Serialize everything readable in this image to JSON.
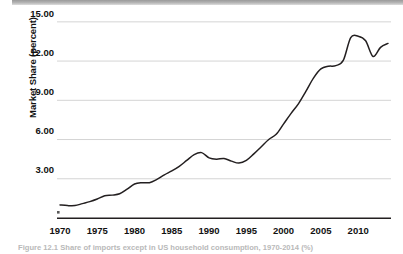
{
  "figure": {
    "caption": "Figure 12.1 Share of imports except in US household consumption, 1970-2014 (%)"
  },
  "chart_data": {
    "type": "line",
    "title": "",
    "xlabel": "",
    "ylabel": "Market Share (percent)",
    "xlim": [
      1970,
      2014
    ],
    "ylim": [
      0,
      15.6
    ],
    "grid": true,
    "legend": "none",
    "yticks": [
      "3.00",
      "6.00",
      "9.00",
      "12.00",
      "15.00"
    ],
    "ytick_values": [
      3.0,
      6.0,
      9.0,
      12.0,
      15.0
    ],
    "xticks": [
      "1970",
      "1975",
      "1980",
      "1985",
      "1990",
      "1995",
      "2000",
      "2005",
      "2010"
    ],
    "xtick_values": [
      1970,
      1975,
      1980,
      1985,
      1990,
      1995,
      2000,
      2005,
      2010
    ],
    "line_color": "#231f20",
    "grid_color": "#d4d4d4",
    "series": [
      {
        "name": "Market Share",
        "x": [
          1970,
          1971,
          1972,
          1973,
          1974,
          1975,
          1976,
          1977,
          1978,
          1979,
          1980,
          1981,
          1982,
          1983,
          1984,
          1985,
          1986,
          1987,
          1988,
          1989,
          1990,
          1991,
          1992,
          1993,
          1994,
          1995,
          1996,
          1997,
          1998,
          1999,
          2000,
          2001,
          2002,
          2003,
          2004,
          2005,
          2006,
          2007,
          2008,
          2009,
          2010,
          2011,
          2012,
          2013,
          2014
        ],
        "values": [
          1.0,
          0.95,
          0.95,
          1.1,
          1.25,
          1.45,
          1.7,
          1.75,
          1.85,
          2.2,
          2.6,
          2.7,
          2.7,
          2.95,
          3.3,
          3.6,
          3.95,
          4.4,
          4.85,
          5.0,
          4.6,
          4.5,
          4.55,
          4.35,
          4.2,
          4.4,
          4.9,
          5.45,
          6.0,
          6.4,
          7.2,
          8.0,
          8.75,
          9.7,
          10.7,
          11.4,
          11.6,
          11.65,
          12.05,
          13.8,
          13.9,
          13.55,
          12.35,
          13.05,
          13.35
        ]
      }
    ]
  }
}
